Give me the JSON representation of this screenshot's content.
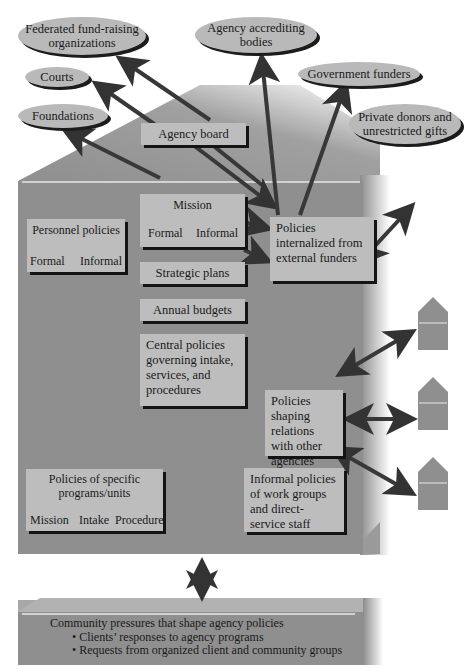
{
  "external_entities": [
    {
      "id": "federated",
      "label": "Federated fund-raising organizations"
    },
    {
      "id": "agency-accrediting",
      "label": "Agency accrediting bodies"
    },
    {
      "id": "courts",
      "label": "Courts"
    },
    {
      "id": "government-funders",
      "label": "Government funders"
    },
    {
      "id": "foundations",
      "label": "Foundations"
    },
    {
      "id": "private-donors",
      "label": "Private donors and unrestricted gifts"
    }
  ],
  "agency": {
    "board": "Agency board",
    "mission": {
      "title": "Mission",
      "branches": [
        "Formal",
        "Informal"
      ]
    },
    "personnel": {
      "title": "Personnel policies",
      "branches": [
        "Formal",
        "Informal"
      ]
    },
    "internalized": "Policies internalized from external funders",
    "strategic": "Strategic plans",
    "budgets": "Annual budgets",
    "central": "Central policies governing intake, services, and procedures",
    "relations": "Policies shaping relations with other agencies",
    "programs": {
      "title": "Policies of specific programs/units",
      "branches": [
        "Mission",
        "Intake",
        "Procedure"
      ]
    },
    "informal": "Informal policies of work groups and direct-service staff"
  },
  "community": {
    "title": "Community pressures that shape agency policies",
    "bullets": [
      "• Clients’ responses to agency programs",
      "• Requests from organized client and community groups"
    ]
  },
  "other_agencies_count": 3,
  "colors": {
    "house": "#8f8f8f",
    "box": "#bdbdbd",
    "arrow": "#3a3a3a",
    "ellipse": "#b9b9b9"
  }
}
